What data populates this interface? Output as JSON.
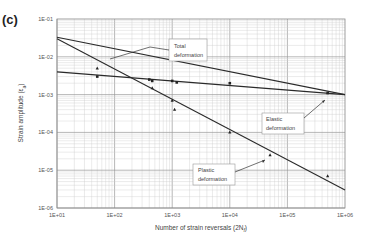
{
  "panel_label": "(c)",
  "chart_data": {
    "type": "line",
    "scale": {
      "x": "log",
      "y": "log"
    },
    "title": "",
    "xlabel": "Number of strain reversals (2N_f)",
    "ylabel": "Strain amplitude (ε_a)",
    "xlim": [
      10,
      1000000
    ],
    "ylim": [
      1e-06,
      0.1
    ],
    "x_ticks": [
      "1E+01",
      "1E+02",
      "1E+03",
      "1E+04",
      "1E+05",
      "1E+06"
    ],
    "y_ticks": [
      "1E-01",
      "1E-02",
      "1E-03",
      "1E-04",
      "1E-05",
      "1E-06"
    ],
    "grid": true,
    "series": [
      {
        "name": "Total deformation",
        "x": [
          10,
          1000000
        ],
        "y": [
          0.033,
          0.001
        ]
      },
      {
        "name": "Elastic deformation",
        "x": [
          10,
          1000000
        ],
        "y": [
          0.004,
          0.001
        ]
      },
      {
        "name": "Plastic deformation",
        "x": [
          10,
          1000000
        ],
        "y": [
          0.03,
          3e-06
        ]
      }
    ],
    "points": {
      "squares": [
        {
          "x": 50,
          "y": 0.003
        },
        {
          "x": 400,
          "y": 0.0025
        },
        {
          "x": 450,
          "y": 0.0023
        },
        {
          "x": 1000,
          "y": 0.0023
        },
        {
          "x": 1200,
          "y": 0.0021
        },
        {
          "x": 10000,
          "y": 0.002
        },
        {
          "x": 500000,
          "y": 0.0011
        }
      ],
      "triangles": [
        {
          "x": 50,
          "y": 0.005
        },
        {
          "x": 450,
          "y": 0.0015
        },
        {
          "x": 1000,
          "y": 0.0007
        },
        {
          "x": 1100,
          "y": 0.0004
        },
        {
          "x": 10000,
          "y": 0.0001
        },
        {
          "x": 50000,
          "y": 2.5e-05
        },
        {
          "x": 500000,
          "y": 7e-06
        }
      ]
    },
    "annotations": [
      {
        "text": "Total deformation",
        "target": "Total deformation"
      },
      {
        "text": "Elastic deformation",
        "target": "Elastic deformation"
      },
      {
        "text": "Plastic deformation",
        "target": "Plastic deformation"
      }
    ]
  },
  "labels": {
    "x_axis": "Number of strain reversals (2N",
    "x_axis_sub": "f",
    "x_axis_end": ")",
    "y_axis": "Strain amplitude (ε",
    "y_axis_sub": "a",
    "y_axis_end": ")",
    "ann_total_1": "Total",
    "ann_total_2": "deformation",
    "ann_elastic_1": "Elastic",
    "ann_elastic_2": "deformation",
    "ann_plastic_1": "Plastic",
    "ann_plastic_2": "deformation"
  }
}
